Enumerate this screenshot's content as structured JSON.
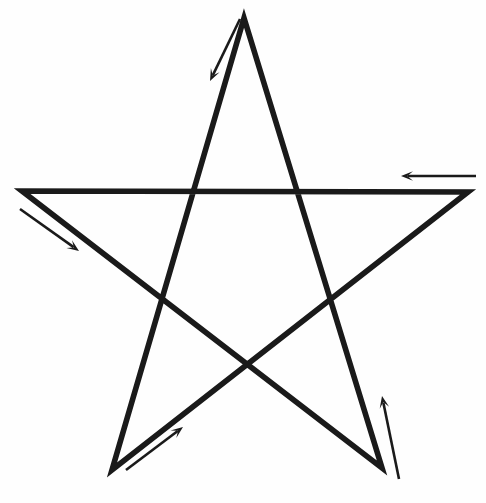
{
  "figure": {
    "background_color": "#fefefe",
    "canvas": {
      "width": 486,
      "height": 503
    }
  },
  "style": {
    "ink_color": "#1a1a1a",
    "star_stroke_width": 5.6,
    "arrow_stroke_width": 2.6,
    "arrow_head_color": "#1a1a1a"
  },
  "star": {
    "shape_name": "pentagram",
    "point_count": 5,
    "closed": true,
    "vertices": [
      {
        "name": "top-apex",
        "x": 244,
        "y": 18
      },
      {
        "name": "bottom-left",
        "x": 112,
        "y": 470
      },
      {
        "name": "right",
        "x": 468,
        "y": 192
      },
      {
        "name": "left",
        "x": 22,
        "y": 191
      },
      {
        "name": "bottom-right",
        "x": 382,
        "y": 468
      }
    ],
    "path_d": "M 244 18 L 112 470 L 468 192 L 22 191 L 382 468 Z"
  },
  "arrows": [
    {
      "name": "arrow-top-descending",
      "label": "stroke-1",
      "direction": "down-left",
      "tail": {
        "x": 240,
        "y": 19
      },
      "tip": {
        "x": 210,
        "y": 81
      },
      "head_size": 12
    },
    {
      "name": "arrow-bottom-left-ascending",
      "label": "stroke-2",
      "direction": "up-right",
      "tail": {
        "x": 126,
        "y": 470
      },
      "tip": {
        "x": 183,
        "y": 427
      },
      "head_size": 12
    },
    {
      "name": "arrow-top-horizontal-leftward",
      "label": "stroke-3",
      "direction": "left",
      "tail": {
        "x": 476,
        "y": 176
      },
      "tip": {
        "x": 401,
        "y": 176
      },
      "head_size": 12
    },
    {
      "name": "arrow-left-descending",
      "label": "stroke-4",
      "direction": "down-right",
      "tail": {
        "x": 20,
        "y": 209
      },
      "tip": {
        "x": 79,
        "y": 251
      },
      "head_size": 12
    },
    {
      "name": "arrow-bottom-right-ascending",
      "label": "stroke-5",
      "direction": "up",
      "tail": {
        "x": 399,
        "y": 479
      },
      "tip": {
        "x": 382,
        "y": 396
      },
      "head_size": 12
    }
  ],
  "chart_data": {
    "type": "diagram",
    "subtitle": "",
    "xlabel": "",
    "ylabel": "",
    "legend": [],
    "annotations": [
      "down-left arrow beside the upper-left edge from the apex",
      "up-right arrow beside the lower-left edge from the bottom-left point",
      "leftward arrow above the horizontal top edge",
      "down-right arrow beside the upper-left slanted edge from the left point",
      "upward arrow beside the lower-right edge from the bottom-right point"
    ]
  }
}
